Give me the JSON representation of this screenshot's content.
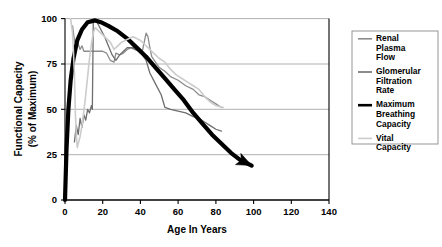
{
  "chart_data": {
    "type": "line",
    "title": "",
    "xlabel": "Age In Years",
    "ylabel": "Functional Capacity\n(% of Maximum)",
    "ylabel_line1": "Functional Capacity",
    "ylabel_line2": "(% of Maximum)",
    "xlim": [
      0,
      140
    ],
    "ylim": [
      0,
      100
    ],
    "xticks": [
      0,
      20,
      40,
      60,
      80,
      100,
      120,
      140
    ],
    "xtick_labels": [
      "0",
      "20",
      "40",
      "60",
      "80",
      "100",
      "120",
      "140"
    ],
    "yticks": [
      0,
      25,
      50,
      75,
      100
    ],
    "ytick_labels": [
      "0",
      "25",
      "50",
      "75",
      "100"
    ],
    "grid": "horizontal",
    "legend_position": "right-outside",
    "series": [
      {
        "name": "Renal Plasma Flow",
        "legend_label_lines": [
          "Renal",
          "Plasma",
          "Flow"
        ],
        "color": "#8c8c8c",
        "width": 1.3,
        "points": [
          [
            4,
            96
          ],
          [
            5,
            88
          ],
          [
            6,
            84
          ],
          [
            7,
            86
          ],
          [
            8,
            83
          ],
          [
            9,
            85
          ],
          [
            10,
            82
          ],
          [
            12,
            82
          ],
          [
            14,
            82
          ],
          [
            16,
            82
          ],
          [
            18,
            82
          ],
          [
            20,
            82
          ],
          [
            22,
            81
          ],
          [
            24,
            77
          ],
          [
            26,
            76
          ],
          [
            27,
            81
          ],
          [
            29,
            80
          ],
          [
            31,
            81
          ],
          [
            33,
            83
          ],
          [
            35,
            84
          ],
          [
            37,
            84
          ],
          [
            39,
            84
          ],
          [
            41,
            82
          ],
          [
            43,
            92
          ],
          [
            44,
            90
          ],
          [
            45,
            84
          ],
          [
            46,
            79
          ],
          [
            48,
            76
          ],
          [
            50,
            73
          ],
          [
            53,
            71
          ],
          [
            56,
            68
          ],
          [
            60,
            66
          ],
          [
            64,
            63
          ],
          [
            68,
            61
          ],
          [
            71,
            58
          ],
          [
            74,
            57
          ],
          [
            77,
            55
          ],
          [
            80,
            53
          ],
          [
            83,
            51
          ]
        ]
      },
      {
        "name": "Glomerular Filtration Rate",
        "legend_label_lines": [
          "Glomerular",
          "Filtration",
          "Rate"
        ],
        "color": "#6e6e6e",
        "width": 1.3,
        "points": [
          [
            5,
            32
          ],
          [
            6,
            41
          ],
          [
            7,
            36
          ],
          [
            8,
            45
          ],
          [
            9,
            40
          ],
          [
            10,
            47
          ],
          [
            11,
            44
          ],
          [
            12,
            50
          ],
          [
            13,
            48
          ],
          [
            14,
            52
          ],
          [
            14.5,
            50
          ],
          [
            15,
            99
          ],
          [
            17,
            98
          ],
          [
            19,
            94
          ],
          [
            21,
            90
          ],
          [
            23,
            85
          ],
          [
            25,
            80
          ],
          [
            27,
            77
          ],
          [
            29,
            80
          ],
          [
            31,
            82
          ],
          [
            33,
            84
          ],
          [
            35,
            84
          ],
          [
            37,
            83
          ],
          [
            39,
            82
          ],
          [
            41,
            80
          ],
          [
            43,
            77
          ],
          [
            45,
            70
          ],
          [
            48,
            64
          ],
          [
            51,
            58
          ],
          [
            53,
            51
          ],
          [
            56,
            50
          ],
          [
            60,
            49
          ],
          [
            64,
            48
          ],
          [
            68,
            46
          ],
          [
            71,
            45
          ],
          [
            74,
            43
          ],
          [
            77,
            41
          ],
          [
            80,
            39
          ],
          [
            83,
            38
          ]
        ]
      },
      {
        "name": "Maximum Breathing Capacity",
        "legend_label_lines": [
          "Maximum",
          "Breathing",
          "Capacity"
        ],
        "color": "#000000",
        "width": 4.2,
        "arrow_end": true,
        "points": [
          [
            0,
            0
          ],
          [
            0.8,
            28
          ],
          [
            1.8,
            50
          ],
          [
            3,
            66
          ],
          [
            4.5,
            78
          ],
          [
            6.5,
            88
          ],
          [
            9,
            94
          ],
          [
            12,
            98
          ],
          [
            16,
            99
          ],
          [
            19,
            98
          ],
          [
            23,
            96
          ],
          [
            28,
            93
          ],
          [
            33,
            89
          ],
          [
            38,
            84
          ],
          [
            43,
            79
          ],
          [
            48,
            73
          ],
          [
            53,
            67
          ],
          [
            58,
            61
          ],
          [
            63,
            55
          ],
          [
            68,
            48
          ],
          [
            73,
            42
          ],
          [
            78,
            36
          ],
          [
            83,
            31
          ],
          [
            88,
            26
          ],
          [
            93,
            22
          ],
          [
            99,
            19
          ]
        ]
      },
      {
        "name": "Vital Capacity",
        "legend_label_lines": [
          "Vital",
          "Capacity"
        ],
        "color": "#cccccc",
        "width": 1.6,
        "points": [
          [
            3,
            100
          ],
          [
            4,
            92
          ],
          [
            5,
            70
          ],
          [
            5.5,
            48
          ],
          [
            6,
            36
          ],
          [
            6.5,
            29
          ],
          [
            7,
            31
          ],
          [
            8,
            35
          ],
          [
            9,
            41
          ],
          [
            10,
            49
          ],
          [
            11,
            58
          ],
          [
            12,
            68
          ],
          [
            13,
            78
          ],
          [
            14,
            86
          ],
          [
            15,
            92
          ],
          [
            16,
            95
          ],
          [
            18,
            93
          ],
          [
            20,
            91
          ],
          [
            22,
            89
          ],
          [
            24,
            87
          ],
          [
            26,
            83
          ],
          [
            28,
            85
          ],
          [
            30,
            87
          ],
          [
            32,
            88
          ],
          [
            34,
            89
          ],
          [
            36,
            90
          ],
          [
            38,
            89
          ],
          [
            40,
            88
          ],
          [
            42,
            86
          ],
          [
            44,
            84
          ],
          [
            46,
            82
          ],
          [
            48,
            80
          ],
          [
            50,
            78
          ],
          [
            53,
            76
          ],
          [
            56,
            72
          ],
          [
            59,
            69
          ],
          [
            62,
            67
          ],
          [
            65,
            65
          ],
          [
            68,
            63
          ],
          [
            71,
            61
          ],
          [
            74,
            57
          ],
          [
            77,
            54
          ],
          [
            80,
            52
          ],
          [
            84,
            51
          ]
        ]
      }
    ]
  },
  "legend": {
    "entries": [
      {
        "lines": [
          "Renal",
          "Plasma",
          "Flow"
        ],
        "color": "#8c8c8c",
        "name": "renal-plasma-flow"
      },
      {
        "lines": [
          "Glomerular",
          "Filtration",
          "Rate"
        ],
        "color": "#6e6e6e",
        "name": "glomerular-filtration-rate"
      },
      {
        "lines": [
          "Maximum",
          "Breathing",
          "Capacity"
        ],
        "color": "#000000",
        "name": "maximum-breathing-capacity"
      },
      {
        "lines": [
          "Vital",
          "Capacity"
        ],
        "color": "#cccccc",
        "name": "vital-capacity"
      }
    ]
  },
  "colors": {
    "axis": "#000000",
    "grid": "#a8a8a8",
    "background": "#ffffff",
    "legend_border": "#8a8a8a"
  }
}
